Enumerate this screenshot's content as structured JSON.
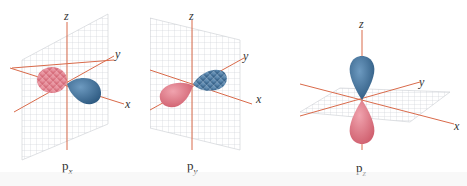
{
  "figure": {
    "colors": {
      "positive_lobe": "#3f6f98",
      "negative_lobe": "#d9707e",
      "axis": "#d96a4a",
      "grid": "#c9ccd2"
    },
    "panels": [
      {
        "id": "px",
        "caption_main": "p",
        "caption_sub": "x",
        "axes": {
          "x": "x",
          "y": "y",
          "z": "z"
        },
        "plane": "yz (vertical, perpendicular to x)",
        "lobe_axis": "x"
      },
      {
        "id": "py",
        "caption_main": "p",
        "caption_sub": "y",
        "axes": {
          "x": "x",
          "y": "y",
          "z": "z"
        },
        "plane": "xz (vertical, perpendicular to y)",
        "lobe_axis": "y"
      },
      {
        "id": "pz",
        "caption_main": "p",
        "caption_sub": "z",
        "axes": {
          "x": "x",
          "y": "y",
          "z": "z"
        },
        "plane": "xy (horizontal, perpendicular to z)",
        "lobe_axis": "z"
      }
    ]
  }
}
